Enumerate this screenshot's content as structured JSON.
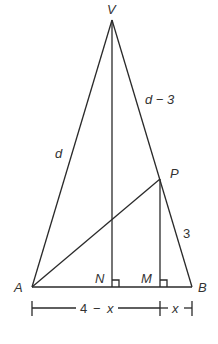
{
  "diagram": {
    "type": "geometry",
    "points": {
      "V": {
        "label": "V",
        "x": 112,
        "y": 20
      },
      "A": {
        "label": "A",
        "x": 32,
        "y": 287
      },
      "B": {
        "label": "B",
        "x": 192,
        "y": 287
      },
      "P": {
        "label": "P",
        "x": 160,
        "y": 179
      },
      "N": {
        "label": "N",
        "x": 112,
        "y": 287
      },
      "M": {
        "label": "M",
        "x": 160,
        "y": 287
      }
    },
    "segment_labels": {
      "VA": "d",
      "VP": "d − 3",
      "PB": "3",
      "AM": "4 − x",
      "MB": "x"
    },
    "dimension_line": {
      "left_label_part1": "4",
      "left_label_dash": "−",
      "left_label_part2": "x",
      "right_label": "x"
    }
  }
}
